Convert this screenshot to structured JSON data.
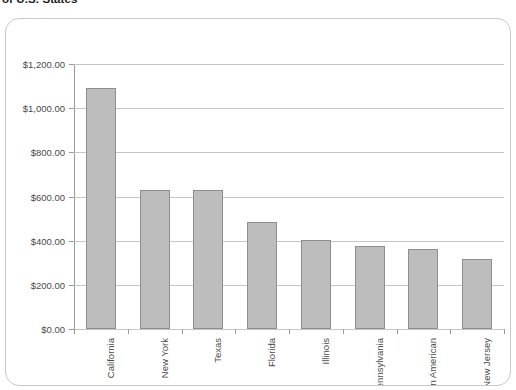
{
  "title": "of U.S. States",
  "chart_data": {
    "type": "bar",
    "title": "of U.S. States",
    "xlabel": "",
    "ylabel": "",
    "categories": [
      "California",
      "New York",
      "Texas",
      "Florida",
      "Illinois",
      "Pennsylvania",
      "Asian American",
      "New Jersey"
    ],
    "values": [
      1090,
      630,
      628,
      485,
      405,
      375,
      362,
      318
    ],
    "ylim": [
      0,
      1200
    ],
    "ytick_values": [
      0,
      200,
      400,
      600,
      800,
      1000,
      1200
    ],
    "ytick_labels": [
      "$0.00",
      "$200.00",
      "$400.00",
      "$600.00",
      "$800.00",
      "$1,000.00",
      "$1,200.00"
    ],
    "grid": true,
    "legend": false,
    "bar_color": "#bdbdbd",
    "bar_border_color": "#8e8e8e",
    "gridline_color": "#c6c6c6",
    "axis_color": "#9a9a9a"
  }
}
